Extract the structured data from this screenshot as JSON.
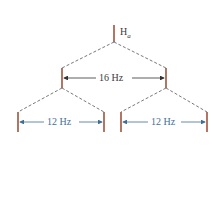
{
  "diagram": {
    "type": "splitting-tree",
    "top_signal": {
      "label": "H",
      "subscript": "a"
    },
    "first_split": {
      "label": "16 Hz"
    },
    "second_splits": [
      {
        "label": "12 Hz"
      },
      {
        "label": "12 Hz"
      }
    ],
    "colors": {
      "signal_lines": "#a0523d",
      "dashed_lines": "#555555",
      "first_split_text": "#3a3a3a",
      "second_split_text": "#3f6f96"
    }
  }
}
